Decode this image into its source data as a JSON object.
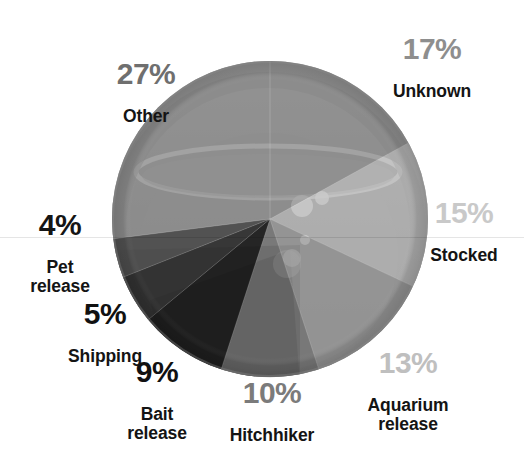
{
  "chart_data": {
    "type": "pie",
    "title": "",
    "subtitle": "",
    "xlabel": "",
    "ylabel": "",
    "legend_position": "around-slices",
    "grid": false,
    "unit": "%",
    "total": 100,
    "categories": [
      "Unknown",
      "Stocked",
      "Aquarium release",
      "Hitchhiker",
      "Bait release",
      "Shipping",
      "Pet release",
      "Other"
    ],
    "values": [
      17,
      15,
      13,
      10,
      9,
      5,
      4,
      27
    ],
    "slices": [
      {
        "label": "Unknown",
        "label_lines": "Unknown",
        "value": 17,
        "percent_text": "17%",
        "percent_color": "#8e8e8e",
        "slice_color": "#8c8c8c",
        "start_angle": 0,
        "end_angle": 61.2
      },
      {
        "label": "Stocked",
        "label_lines": "Stocked",
        "value": 15,
        "percent_text": "15%",
        "percent_color": "#c9c9c9",
        "slice_color": "#c2c2c2",
        "start_angle": 61.2,
        "end_angle": 115.2
      },
      {
        "label": "Aquarium release",
        "label_lines": "Aquarium\nrelease",
        "value": 13,
        "percent_text": "13%",
        "percent_color": "#bfbfbf",
        "slice_color": "#9a9a9a",
        "start_angle": 115.2,
        "end_angle": 162.0
      },
      {
        "label": "Hitchhiker",
        "label_lines": "Hitchhiker",
        "value": 10,
        "percent_text": "10%",
        "percent_color": "#7b7b7b",
        "slice_color": "#6e6e6e",
        "start_angle": 162.0,
        "end_angle": 198.0
      },
      {
        "label": "Bait release",
        "label_lines": "Bait\nrelease",
        "value": 9,
        "percent_text": "9%",
        "percent_color": "#111111",
        "slice_color": "#171717",
        "start_angle": 198.0,
        "end_angle": 230.4
      },
      {
        "label": "Shipping",
        "label_lines": "Shipping",
        "value": 5,
        "percent_text": "5%",
        "percent_color": "#111111",
        "slice_color": "#2b2b2b",
        "start_angle": 230.4,
        "end_angle": 248.4
      },
      {
        "label": "Pet release",
        "label_lines": "Pet\nrelease",
        "value": 4,
        "percent_text": "4%",
        "percent_color": "#151515",
        "slice_color": "#4a4a4a",
        "start_angle": 248.4,
        "end_angle": 262.8
      },
      {
        "label": "Other",
        "label_lines": "Other",
        "value": 27,
        "percent_text": "27%",
        "percent_color": "#6f6f6f",
        "slice_color": "#8c8c8c",
        "start_angle": 262.8,
        "end_angle": 360.0
      }
    ],
    "geometry": {
      "center_x": 270,
      "center_y": 219,
      "radius": 158
    },
    "colors": {
      "background": "#ffffff",
      "text": "#141414",
      "rim": "#8b8b8b",
      "bowl_highlight": "#cfcfcf"
    }
  }
}
